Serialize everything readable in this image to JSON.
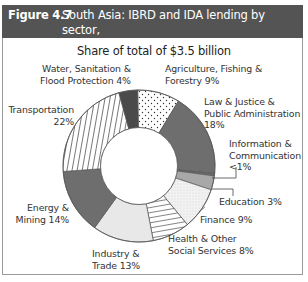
{
  "figure": {
    "number": "Figure 4.7",
    "title": "South Asia: IBRD and IDA lending by sector, fiscal 2002",
    "title_line1": "South Asia: IBRD and IDA lending by sector,",
    "title_line2": "fiscal 2002",
    "subtitle": "Share of total of $3.5 billion"
  },
  "labels": {
    "water_1": "Water, Sanitation &",
    "water_2": "Flood Protection 4%",
    "agri_1": "Agriculture, Fishing &",
    "agri_2": "Forestry 9%",
    "law_1": "Law & Justice &",
    "law_2": "Public Administration",
    "law_3": "18%",
    "info_1": "Information &",
    "info_2": "Communication",
    "info_3": "<1%",
    "edu_1": "Education 3%",
    "fin_1": "Finance 9%",
    "health_1": "Health & Other",
    "health_2": "Social Services 8%",
    "ind_1": "Industry &",
    "ind_2": "Trade 13%",
    "energy_1": "Energy &",
    "energy_2": "Mining 14%",
    "trans_1": "Transportation",
    "trans_2": "22%"
  },
  "colors": {
    "title_bar": "#545454",
    "dark_fill": "#5a5a5a",
    "mid_fill": "#8a8a8a",
    "light_fill": "#e6e6e6",
    "medium_light": "#b0b0b0",
    "outline": "#555555"
  },
  "chart_data": {
    "type": "pie",
    "variant": "donut",
    "title": "South Asia: IBRD and IDA lending by sector, fiscal 2002",
    "subtitle": "Share of total of $3.5 billion",
    "unit": "%",
    "start_angle": "12 o'clock",
    "direction": "clockwise",
    "categories": [
      "Agriculture, Fishing & Forestry",
      "Law & Justice & Public Administration",
      "Information & Communication",
      "Education",
      "Finance",
      "Health & Other Social Services",
      "Industry & Trade",
      "Energy & Mining",
      "Transportation",
      "Water, Sanitation & Flood Protection"
    ],
    "values": [
      9,
      18,
      0.5,
      3,
      9,
      8,
      13,
      14,
      22,
      4
    ],
    "value_labels": [
      "9%",
      "18%",
      "<1%",
      "3%",
      "9%",
      "8%",
      "13%",
      "14%",
      "22%",
      "4%"
    ],
    "patterns": [
      "dots",
      "dark-gray",
      "dark-gray-thin",
      "medium-gray",
      "light-dotted",
      "horizontal-lines",
      "light-gray",
      "dark-gray",
      "vertical-lines",
      "very-dark"
    ],
    "legend": "none (direct labels)"
  }
}
